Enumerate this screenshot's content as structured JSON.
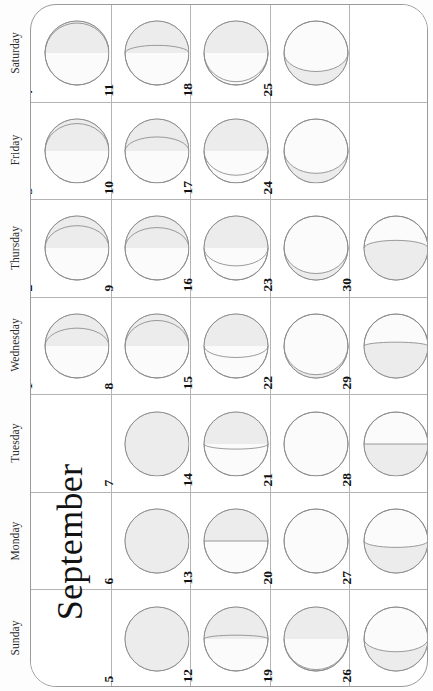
{
  "calendar": {
    "month_title": "September",
    "orientation": "rotated-90-ccw",
    "day_names": [
      "Saturday",
      "Friday",
      "Thursday",
      "Wednesday",
      "Tuesday",
      "Monday",
      "Sunday"
    ],
    "colors": {
      "lit_fill": "#ececec",
      "dark_fill": "#fbfbfb",
      "disc_outline": "#8f8f8f",
      "grid_line": "#b4b4b4",
      "frame_line": "#9a9a9a",
      "text": "#111111"
    },
    "weeks": [
      {
        "index": 1,
        "days": [
          {
            "date": "4",
            "day_name": "Saturday",
            "illumination": 0.97,
            "phase": "waning-gibbous",
            "waxing": false
          },
          {
            "date": "3",
            "day_name": "Friday",
            "illumination": 0.93,
            "phase": "waning-gibbous",
            "waxing": false
          },
          {
            "date": "2",
            "day_name": "Thursday",
            "illumination": 0.85,
            "phase": "waning-gibbous",
            "waxing": false
          },
          {
            "date": "1",
            "day_name": "Wednesday",
            "illumination": 0.78,
            "phase": "waning-gibbous",
            "waxing": false
          },
          {
            "date": "",
            "day_name": "Tuesday",
            "illumination": null,
            "phase": "empty",
            "waxing": false
          },
          {
            "date": "",
            "day_name": "Monday",
            "illumination": null,
            "phase": "empty",
            "waxing": false
          },
          {
            "date": "",
            "day_name": "Sunday",
            "illumination": null,
            "phase": "empty",
            "waxing": false
          }
        ]
      },
      {
        "index": 2,
        "days": [
          {
            "date": "11",
            "day_name": "Saturday",
            "illumination": 0.62,
            "phase": "waning-gibbous",
            "waxing": false
          },
          {
            "date": "10",
            "day_name": "Friday",
            "illumination": 0.72,
            "phase": "waning-gibbous",
            "waxing": false
          },
          {
            "date": "9",
            "day_name": "Thursday",
            "illumination": 0.82,
            "phase": "waning-gibbous",
            "waxing": false
          },
          {
            "date": "8",
            "day_name": "Wednesday",
            "illumination": 0.9,
            "phase": "waning-gibbous",
            "waxing": false
          },
          {
            "date": "7",
            "day_name": "Tuesday",
            "illumination": 1.0,
            "phase": "full-moon",
            "waxing": false
          },
          {
            "date": "6",
            "day_name": "Monday",
            "illumination": 1.0,
            "phase": "full-moon",
            "waxing": false
          },
          {
            "date": "5",
            "day_name": "Sunday",
            "illumination": 1.0,
            "phase": "full-moon",
            "waxing": false
          }
        ]
      },
      {
        "index": 3,
        "days": [
          {
            "date": "18",
            "day_name": "Saturday",
            "illumination": 0.05,
            "phase": "waning-crescent",
            "waxing": false
          },
          {
            "date": "17",
            "day_name": "Friday",
            "illumination": 0.12,
            "phase": "waning-crescent",
            "waxing": false
          },
          {
            "date": "16",
            "day_name": "Thursday",
            "illumination": 0.22,
            "phase": "waning-crescent",
            "waxing": false
          },
          {
            "date": "15",
            "day_name": "Wednesday",
            "illumination": 0.32,
            "phase": "waning-crescent",
            "waxing": false
          },
          {
            "date": "14",
            "day_name": "Tuesday",
            "illumination": 0.42,
            "phase": "waning-crescent",
            "waxing": false
          },
          {
            "date": "13",
            "day_name": "Monday",
            "illumination": 0.5,
            "phase": "last-quarter",
            "waxing": false
          },
          {
            "date": "12",
            "day_name": "Sunday",
            "illumination": 0.56,
            "phase": "waning-gibbous",
            "waxing": false
          }
        ]
      },
      {
        "index": 4,
        "days": [
          {
            "date": "25",
            "day_name": "Saturday",
            "illumination": 0.21,
            "phase": "waxing-crescent",
            "waxing": true
          },
          {
            "date": "24",
            "day_name": "Friday",
            "illumination": 0.15,
            "phase": "waxing-crescent",
            "waxing": true
          },
          {
            "date": "23",
            "day_name": "Thursday",
            "illumination": 0.1,
            "phase": "waxing-crescent",
            "waxing": true
          },
          {
            "date": "22",
            "day_name": "Wednesday",
            "illumination": 0.05,
            "phase": "waxing-crescent",
            "waxing": true
          },
          {
            "date": "21",
            "day_name": "Tuesday",
            "illumination": 0.01,
            "phase": "new-moon",
            "waxing": true
          },
          {
            "date": "20",
            "day_name": "Monday",
            "illumination": 0.0,
            "phase": "new-moon",
            "waxing": true
          },
          {
            "date": "19",
            "day_name": "Sunday",
            "illumination": 0.02,
            "phase": "new-moon",
            "waxing": false
          }
        ]
      },
      {
        "index": 5,
        "days": [
          {
            "date": "",
            "day_name": "Saturday",
            "illumination": null,
            "phase": "empty",
            "waxing": false
          },
          {
            "date": "",
            "day_name": "Friday",
            "illumination": null,
            "phase": "empty",
            "waxing": false
          },
          {
            "date": "30",
            "day_name": "Thursday",
            "illumination": 0.62,
            "phase": "waxing-gibbous",
            "waxing": true
          },
          {
            "date": "29",
            "day_name": "Wednesday",
            "illumination": 0.56,
            "phase": "waxing-gibbous",
            "waxing": true
          },
          {
            "date": "28",
            "day_name": "Tuesday",
            "illumination": 0.5,
            "phase": "first-quarter",
            "waxing": true
          },
          {
            "date": "27",
            "day_name": "Monday",
            "illumination": 0.4,
            "phase": "waxing-crescent",
            "waxing": true
          },
          {
            "date": "26",
            "day_name": "Sunday",
            "illumination": 0.3,
            "phase": "waxing-crescent",
            "waxing": true
          }
        ]
      }
    ]
  }
}
